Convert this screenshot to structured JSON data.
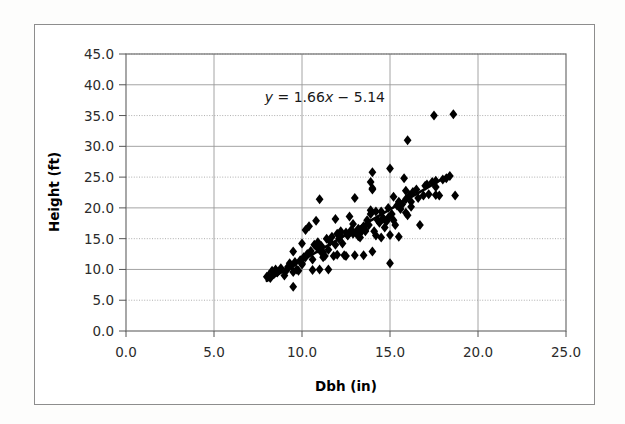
{
  "figure": {
    "background_color": "#ffffff",
    "frame_color": "#8d8d8d",
    "marker_color": "#000000",
    "trendline_color": "#000000",
    "gridline_color": "#9a9a9a",
    "axis_color": "#555555"
  },
  "chart_data": {
    "type": "scatter",
    "title": "",
    "xlabel": "Dbh (in)",
    "ylabel": "Height (ft)",
    "xlim": [
      0.0,
      25.0
    ],
    "ylim": [
      0.0,
      45.0
    ],
    "xticks": [
      0.0,
      5.0,
      10.0,
      15.0,
      20.0,
      25.0
    ],
    "yticks": [
      0.0,
      5.0,
      10.0,
      15.0,
      20.0,
      25.0,
      30.0,
      35.0,
      40.0,
      45.0
    ],
    "xtick_labels": [
      "0.0",
      "5.0",
      "10.0",
      "15.0",
      "20.0",
      "25.0"
    ],
    "ytick_labels": [
      "0.0",
      "5.0",
      "10.0",
      "15.0",
      "20.0",
      "25.0",
      "30.0",
      "35.0",
      "40.0",
      "45.0"
    ],
    "grid": true,
    "grid_axis": "both",
    "legend": false,
    "marker": "diamond",
    "marker_size": 5,
    "annotations": [
      {
        "name": "regression-equation",
        "text": "y = 1.66x − 5.14",
        "text_parts": [
          "y",
          " = 1.66",
          "x",
          " − 5.14"
        ],
        "x": 11.3,
        "y": 37.2
      }
    ],
    "trendline": {
      "name": "linear-fit",
      "equation": "y = 1.66x - 5.14",
      "slope": 1.66,
      "intercept": -5.14,
      "x_start": 8.0,
      "x_end": 18.4,
      "y_start": 8.14,
      "y_end": 25.4
    },
    "x": [
      8.0,
      8.1,
      8.2,
      8.3,
      8.4,
      8.5,
      8.6,
      8.8,
      9.0,
      9.1,
      9.2,
      9.3,
      9.4,
      9.5,
      9.5,
      9.6,
      9.7,
      9.8,
      9.9,
      10.0,
      10.0,
      10.1,
      10.2,
      10.3,
      10.4,
      10.5,
      10.6,
      10.7,
      10.8,
      10.9,
      11.0,
      11.0,
      11.1,
      11.2,
      11.3,
      11.4,
      11.5,
      11.5,
      11.6,
      11.7,
      11.8,
      11.9,
      12.0,
      12.0,
      12.1,
      12.2,
      12.3,
      12.4,
      12.5,
      12.5,
      12.6,
      12.7,
      12.8,
      12.9,
      13.0,
      13.0,
      13.1,
      13.2,
      13.3,
      13.4,
      13.5,
      13.5,
      13.6,
      13.7,
      13.8,
      13.9,
      14.0,
      14.0,
      14.1,
      14.2,
      14.3,
      14.4,
      14.5,
      14.5,
      14.6,
      14.7,
      14.8,
      14.9,
      15.0,
      15.0,
      15.1,
      15.2,
      15.3,
      15.4,
      15.5,
      15.5,
      15.6,
      15.7,
      15.8,
      15.9,
      16.0,
      16.0,
      16.1,
      16.2,
      16.3,
      16.5,
      16.7,
      16.9,
      17.0,
      17.2,
      17.4,
      17.5,
      17.6,
      17.8,
      18.0,
      18.2,
      18.4,
      18.6,
      9.3,
      10.9,
      11.9,
      12.9,
      13.9,
      14.9,
      15.9,
      10.2,
      11.2,
      12.2,
      13.2,
      14.2,
      15.2,
      16.2,
      17.6,
      18.7,
      15.9,
      14.0,
      13.9,
      14.0,
      15.0,
      9.5,
      10.0,
      10.6,
      11.1,
      12.6,
      13.6,
      14.6,
      15.6,
      16.6,
      17.1,
      17.6
    ],
    "y": [
      8.8,
      9.0,
      8.6,
      9.8,
      9.2,
      10.0,
      9.5,
      10.2,
      9.0,
      9.8,
      10.4,
      11.0,
      10.6,
      7.2,
      12.9,
      11.2,
      10.0,
      9.8,
      11.5,
      11.0,
      14.2,
      12.0,
      16.4,
      12.5,
      17.0,
      13.0,
      9.9,
      14.0,
      17.9,
      14.4,
      10.0,
      21.4,
      13.8,
      12.8,
      12.2,
      15.0,
      10.0,
      13.2,
      14.5,
      15.3,
      12.2,
      18.2,
      12.4,
      15.8,
      15.0,
      16.2,
      14.2,
      12.3,
      12.2,
      16.0,
      15.5,
      18.6,
      16.4,
      15.8,
      12.3,
      21.6,
      16.0,
      16.6,
      15.2,
      16.2,
      12.3,
      17.0,
      16.4,
      18.0,
      17.2,
      19.0,
      12.9,
      23.0,
      16.2,
      15.5,
      18.0,
      17.6,
      15.2,
      19.4,
      18.2,
      16.8,
      17.8,
      18.4,
      11.0,
      26.4,
      19.0,
      18.0,
      17.2,
      20.4,
      15.3,
      21.0,
      19.8,
      20.6,
      24.8,
      21.4,
      18.8,
      31.0,
      22.0,
      21.0,
      22.6,
      23.0,
      17.2,
      22.0,
      23.6,
      22.2,
      24.2,
      35.0,
      23.4,
      22.0,
      24.6,
      24.8,
      25.2,
      35.2,
      10.5,
      13.4,
      14.0,
      17.4,
      19.6,
      20.0,
      22.8,
      12.0,
      12.0,
      15.5,
      15.4,
      19.4,
      21.8,
      20.2,
      22.1,
      22.0,
      19.2,
      25.8,
      24.2,
      23.2,
      15.6,
      9.6,
      10.8,
      11.6,
      12.8,
      15.6,
      16.2,
      18.4,
      20.6,
      21.6,
      23.8,
      24.4
    ]
  }
}
